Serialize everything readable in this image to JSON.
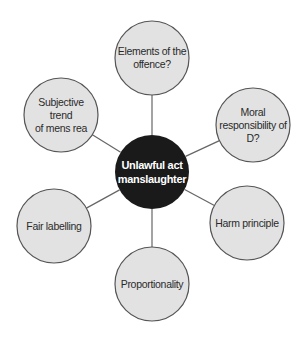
{
  "diagram": {
    "type": "mind-map",
    "center": {
      "label": "Unlawful act\nmanslaughter",
      "cx": 152,
      "cy": 172,
      "r": 37,
      "fill": "#1a1a1a",
      "text_color": "#ffffff"
    },
    "nodes": [
      {
        "id": "elements",
        "label": "Elements of the\noffence?",
        "cx": 152,
        "cy": 58,
        "r": 37
      },
      {
        "id": "moral",
        "label": "Moral\nresponsibility of\nD?",
        "cx": 253,
        "cy": 125,
        "r": 37
      },
      {
        "id": "harm",
        "label": "Harm principle",
        "cx": 247,
        "cy": 223,
        "r": 37
      },
      {
        "id": "proportionality",
        "label": "Proportionality",
        "cx": 152,
        "cy": 284,
        "r": 37
      },
      {
        "id": "fair-labelling",
        "label": "Fair labelling",
        "cx": 54,
        "cy": 226,
        "r": 37
      },
      {
        "id": "subjective",
        "label": "Subjective trend\nof mens rea",
        "cx": 61,
        "cy": 115,
        "r": 37
      }
    ],
    "colors": {
      "node_fill": "#e2e2e2",
      "node_stroke": "#555555",
      "connector": "#666666",
      "background": "#ffffff"
    }
  }
}
